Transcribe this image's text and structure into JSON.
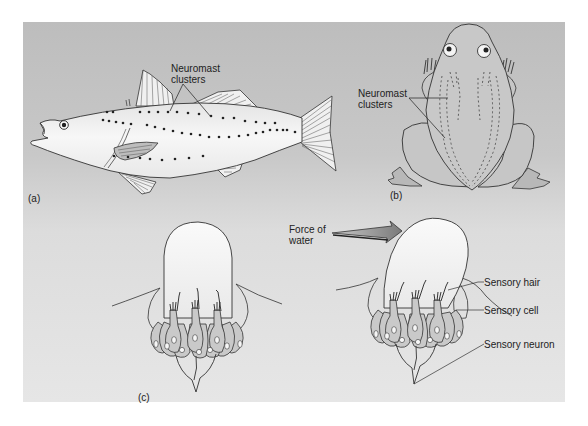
{
  "figure": {
    "panel_a": {
      "tag": "(a)",
      "subject": "fish",
      "callout": [
        "Neuromast",
        "clusters"
      ]
    },
    "panel_b": {
      "tag": "(b)",
      "subject": "frog",
      "callout": [
        "Neuromast",
        "clusters"
      ]
    },
    "panel_c": {
      "tag": "(c)",
      "subject": "neuromast cross-section",
      "force_label": [
        "Force of",
        "water"
      ],
      "labels": {
        "sensory_hair": "Sensory hair",
        "sensory_cell": "Sensory cell",
        "sensory_neuron": "Sensory neuron"
      }
    }
  },
  "colors": {
    "panel_top": "#bdbdbd",
    "panel_bottom": "#e6e6e6",
    "body_fill": "#f2f2f2",
    "frog_fill": "#c4c4c4",
    "cupula_fill": "#f5f5f5",
    "cell_fill": "#c9c9c9",
    "arrow_fill": "#8a8a8a",
    "ink": "#222222"
  }
}
